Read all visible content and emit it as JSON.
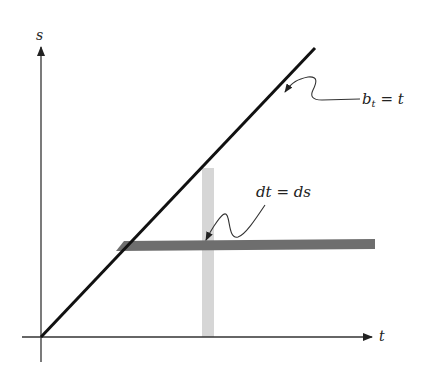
{
  "diagram": {
    "axes": {
      "x_label": "t",
      "y_label": "s"
    },
    "line_label": {
      "base": "b",
      "subscript": "t",
      "rest": " = t"
    },
    "band_label": "dt = ds",
    "colors": {
      "axis": "#333333",
      "diagonal": "#111111",
      "horizontal_band": "#6e6e6e",
      "vertical_band": "#d6d6d6",
      "text": "#222222"
    }
  }
}
